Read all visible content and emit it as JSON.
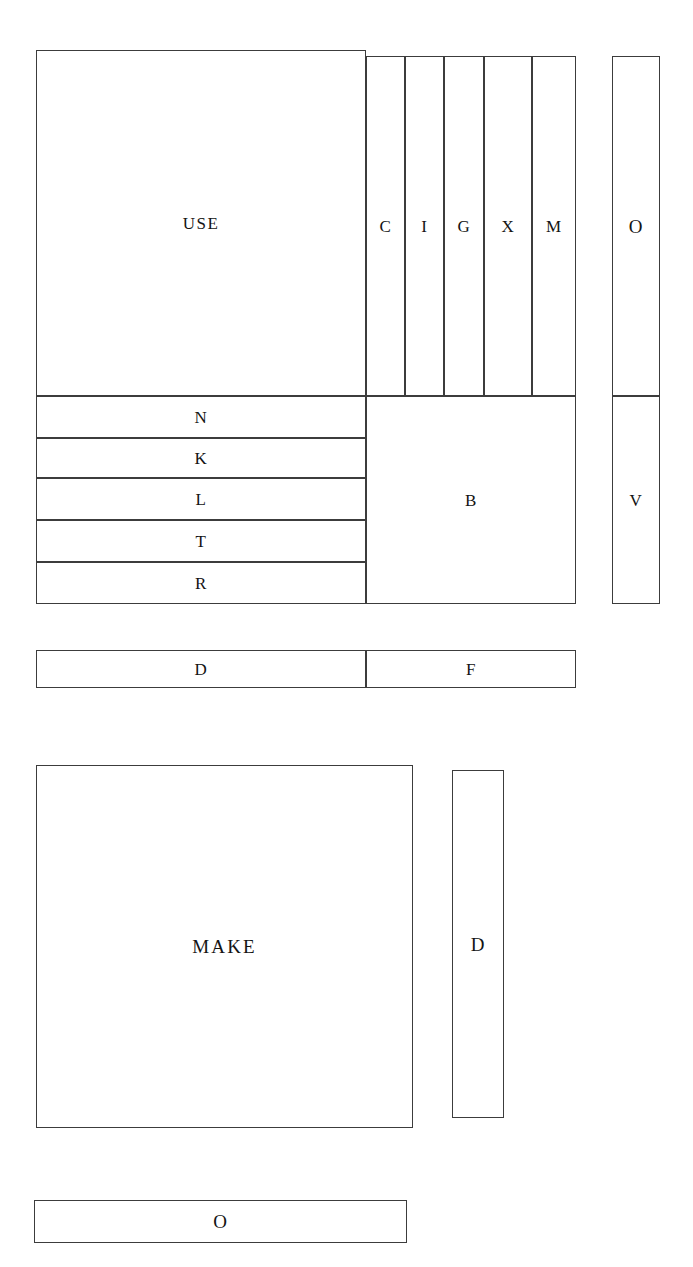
{
  "diagram": {
    "kind": "treemap",
    "background_color": "#ffffff",
    "stroke_color": "#3c3c3c",
    "label_color": "#141414",
    "canvas": {
      "width": 693,
      "height": 1267
    }
  },
  "chart_data": {
    "type": "treemap",
    "title": "",
    "xlabel": "",
    "ylabel": "",
    "grid": false,
    "legend": "none",
    "groups": [
      {
        "name": "upper-cluster",
        "nodes": [
          {
            "label": "USE",
            "x": 36,
            "y": 50,
            "w": 330,
            "h": 346,
            "size": "large"
          },
          {
            "label": "C",
            "x": 366,
            "y": 56,
            "w": 39,
            "h": 340,
            "size": "letter"
          },
          {
            "label": "I",
            "x": 405,
            "y": 56,
            "w": 39,
            "h": 340,
            "size": "letter"
          },
          {
            "label": "G",
            "x": 444,
            "y": 56,
            "w": 40,
            "h": 340,
            "size": "letter"
          },
          {
            "label": "X",
            "x": 484,
            "y": 56,
            "w": 48,
            "h": 340,
            "size": "letter"
          },
          {
            "label": "M",
            "x": 532,
            "y": 56,
            "w": 44,
            "h": 340,
            "size": "letter"
          },
          {
            "label": "N",
            "x": 36,
            "y": 396,
            "w": 330,
            "h": 42,
            "size": "letter"
          },
          {
            "label": "K",
            "x": 36,
            "y": 438,
            "w": 330,
            "h": 40,
            "size": "letter"
          },
          {
            "label": "L",
            "x": 36,
            "y": 478,
            "w": 330,
            "h": 42,
            "size": "letter"
          },
          {
            "label": "T",
            "x": 36,
            "y": 520,
            "w": 330,
            "h": 42,
            "size": "letter"
          },
          {
            "label": "R",
            "x": 36,
            "y": 562,
            "w": 330,
            "h": 42,
            "size": "letter"
          },
          {
            "label": "B",
            "x": 366,
            "y": 396,
            "w": 210,
            "h": 208,
            "size": "letter"
          }
        ]
      },
      {
        "name": "right-column-cluster",
        "nodes": [
          {
            "label": "O",
            "x": 612,
            "y": 56,
            "w": 48,
            "h": 340,
            "size": "letter-lg"
          },
          {
            "label": "V",
            "x": 612,
            "y": 396,
            "w": 48,
            "h": 208,
            "size": "letter"
          }
        ]
      },
      {
        "name": "mid-bar-cluster",
        "nodes": [
          {
            "label": "D",
            "x": 36,
            "y": 650,
            "w": 330,
            "h": 38,
            "size": "letter"
          },
          {
            "label": "F",
            "x": 366,
            "y": 650,
            "w": 210,
            "h": 38,
            "size": "letter"
          }
        ]
      },
      {
        "name": "lower-cluster",
        "nodes": [
          {
            "label": "MAKE",
            "x": 36,
            "y": 765,
            "w": 377,
            "h": 363,
            "size": "word-lg"
          },
          {
            "label": "D",
            "x": 452,
            "y": 770,
            "w": 52,
            "h": 348,
            "size": "letter-lg"
          }
        ]
      },
      {
        "name": "bottom-bar-cluster",
        "nodes": [
          {
            "label": "O",
            "x": 34,
            "y": 1200,
            "w": 373,
            "h": 43,
            "size": "letter-lg"
          }
        ]
      }
    ]
  }
}
